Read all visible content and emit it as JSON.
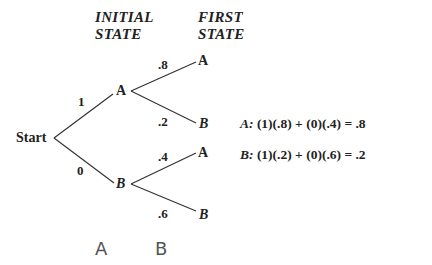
{
  "headers": {
    "initial": [
      "INITIAL",
      "STATE"
    ],
    "first": [
      "FIRST",
      "STATE"
    ]
  },
  "tree": {
    "root": "Start",
    "level1": [
      {
        "label": "A",
        "prob": "1"
      },
      {
        "label": "B",
        "prob": "0"
      }
    ],
    "level2": [
      {
        "from": "A",
        "label": "A",
        "prob": ".8"
      },
      {
        "from": "A",
        "label": "B",
        "prob": ".2"
      },
      {
        "from": "B",
        "label": "A",
        "prob": ".4"
      },
      {
        "from": "B",
        "label": "B",
        "prob": ".6"
      }
    ]
  },
  "equations": [
    {
      "var": "A:",
      "expr": "(1)(.8) + (0)(.4) = .8"
    },
    {
      "var": "B:",
      "expr": "(1)(.2) + (0)(.6) = .2"
    }
  ],
  "handwritten": [
    "A",
    "B"
  ],
  "colors": {
    "ink": "#222222",
    "line": "#333333",
    "handwriting": "#555555",
    "background": "#ffffff"
  }
}
